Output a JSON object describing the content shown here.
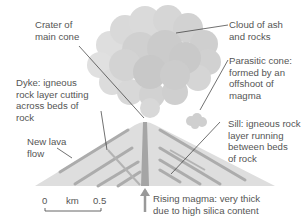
{
  "labels": {
    "crater": "Crater of\nmain cone",
    "cloud": "Cloud of ash\nand rocks",
    "dyke": "Dyke: igneous\nrock layer cutting\nacross beds of\nrock",
    "parasitic": "Parasitic cone:\nformed by an\noffshoot of\nmagma",
    "lava": "New lava\nflow",
    "sill": "Sill: igneous rock\nlayer running\nbetween beds\nof rock",
    "magma": "Rising magma: very thick\ndue to high silica content"
  },
  "scale": {
    "start": "0",
    "unit": "km",
    "end": "0.5"
  },
  "colors": {
    "cone": "#dcdcdc",
    "layers": "#a8a8a8",
    "cloud": "#cfcfcf",
    "leader": "#333333",
    "text": "#555555"
  }
}
